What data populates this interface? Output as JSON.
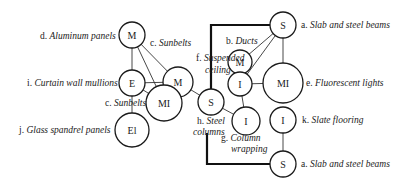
{
  "diagram": {
    "nodes": [
      {
        "id": "n_m_top",
        "symbol": "M",
        "cx": 132,
        "cy": 35,
        "r": 13
      },
      {
        "id": "n_e",
        "symbol": "E",
        "cx": 132,
        "cy": 83,
        "r": 13
      },
      {
        "id": "n_m_mid",
        "symbol": "M",
        "cx": 178,
        "cy": 82,
        "r": 15
      },
      {
        "id": "n_mi_left",
        "symbol": "MI",
        "cx": 164,
        "cy": 103,
        "r": 18
      },
      {
        "id": "n_el",
        "symbol": "El",
        "cx": 132,
        "cy": 130,
        "r": 17
      },
      {
        "id": "n_s_mid",
        "symbol": "S",
        "cx": 211,
        "cy": 102,
        "r": 13
      },
      {
        "id": "n_s_top",
        "symbol": "S",
        "cx": 283,
        "cy": 25,
        "r": 13
      },
      {
        "id": "n_m_ducts",
        "symbol": "M",
        "cx": 240,
        "cy": 62,
        "r": 12
      },
      {
        "id": "n_i_ducts",
        "symbol": "I",
        "cx": 240,
        "cy": 84,
        "r": 12
      },
      {
        "id": "n_mi_right",
        "symbol": "MI",
        "cx": 283,
        "cy": 83,
        "r": 20
      },
      {
        "id": "n_i_wrap",
        "symbol": "I",
        "cx": 246,
        "cy": 121,
        "r": 14
      },
      {
        "id": "n_i_slate",
        "symbol": "I",
        "cx": 283,
        "cy": 120,
        "r": 13
      },
      {
        "id": "n_s_bot",
        "symbol": "S",
        "cx": 283,
        "cy": 164,
        "r": 13
      }
    ],
    "labels": [
      {
        "id": "lbl_d",
        "prefix": "d.",
        "text": "Aluminum panels",
        "x": 40,
        "y": 39,
        "anchor": "start"
      },
      {
        "id": "lbl_c_top",
        "prefix": "c.",
        "text": "Sunbelts",
        "x": 150,
        "y": 46,
        "anchor": "start"
      },
      {
        "id": "lbl_f1",
        "prefix": "f.",
        "text": "Suspended",
        "x": 196,
        "y": 61,
        "anchor": "start"
      },
      {
        "id": "lbl_f2",
        "prefix": "",
        "text": "ceiling",
        "x": 205,
        "y": 73,
        "anchor": "start"
      },
      {
        "id": "lbl_b",
        "prefix": "b.",
        "text": "Ducts",
        "x": 226,
        "y": 44,
        "anchor": "start"
      },
      {
        "id": "lbl_a_top",
        "prefix": "a.",
        "text": "Slab and steel beams",
        "x": 301,
        "y": 28,
        "anchor": "start"
      },
      {
        "id": "lbl_i",
        "prefix": "i.",
        "text": "Curtain wall mullions",
        "x": 27,
        "y": 86,
        "anchor": "start"
      },
      {
        "id": "lbl_e",
        "prefix": "e.",
        "text": "Fluorescent lights",
        "x": 306,
        "y": 86,
        "anchor": "start"
      },
      {
        "id": "lbl_c_bot",
        "prefix": "c.",
        "text": "Sunbelts",
        "x": 105,
        "y": 106,
        "anchor": "start"
      },
      {
        "id": "lbl_h1",
        "prefix": "h.",
        "text": "Steel",
        "x": 197,
        "y": 124,
        "anchor": "start"
      },
      {
        "id": "lbl_h2",
        "prefix": "",
        "text": "columns",
        "x": 193,
        "y": 135,
        "anchor": "start"
      },
      {
        "id": "lbl_k",
        "prefix": "k.",
        "text": "Slate flooring",
        "x": 302,
        "y": 123,
        "anchor": "start"
      },
      {
        "id": "lbl_j",
        "prefix": "j.",
        "text": "Glass spandrel panels",
        "x": 19,
        "y": 133,
        "anchor": "start"
      },
      {
        "id": "lbl_g1",
        "prefix": "g.",
        "text": "Column",
        "x": 221,
        "y": 141,
        "anchor": "start"
      },
      {
        "id": "lbl_g2",
        "prefix": "",
        "text": "wrapping",
        "x": 231,
        "y": 152,
        "anchor": "start"
      },
      {
        "id": "lbl_a_bot",
        "prefix": "a.",
        "text": "Slab and steel beams",
        "x": 301,
        "y": 167,
        "anchor": "start"
      }
    ],
    "edges": [
      {
        "from": "n_m_top",
        "to": "n_e"
      },
      {
        "from": "n_m_top",
        "to": "n_m_mid"
      },
      {
        "from": "n_m_top",
        "to": "n_mi_left"
      },
      {
        "from": "n_e",
        "to": "n_m_mid"
      },
      {
        "from": "n_e",
        "to": "n_mi_left"
      },
      {
        "from": "n_e",
        "to": "n_el"
      },
      {
        "from": "n_m_mid",
        "to": "n_s_mid"
      },
      {
        "from": "n_s_mid",
        "to": "n_i_wrap"
      },
      {
        "from": "n_s_top",
        "to": "n_m_ducts"
      },
      {
        "from": "n_s_top",
        "to": "n_i_ducts"
      },
      {
        "from": "n_s_top",
        "to": "n_mi_right"
      },
      {
        "from": "n_i_ducts",
        "to": "n_mi_right"
      },
      {
        "from": "n_i_ducts",
        "to": "n_i_wrap"
      },
      {
        "from": "n_i_slate",
        "to": "n_s_bot"
      }
    ],
    "bold_paths": [
      {
        "id": "bold_top",
        "points": "270,25 211,25 211,89"
      },
      {
        "id": "bold_bottom",
        "points": "207,133 207,164 270,164"
      }
    ]
  }
}
